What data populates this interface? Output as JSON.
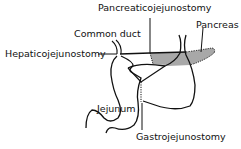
{
  "diagram": {
    "title": "",
    "labels": {
      "pancreaticojejunostomy": "Pancreaticojejunostomy",
      "pancreas": "Pancreas",
      "common_duct": "Common duct",
      "hepaticojejunostomy": "Hepaticojejunostomy",
      "jejunum": "Jejunum",
      "gastrojejunostomy": "Gastrojejunostomy"
    },
    "colors": {
      "line": "#111111",
      "pancreas_fill": "#a8a8a8",
      "background": "#ffffff"
    }
  }
}
